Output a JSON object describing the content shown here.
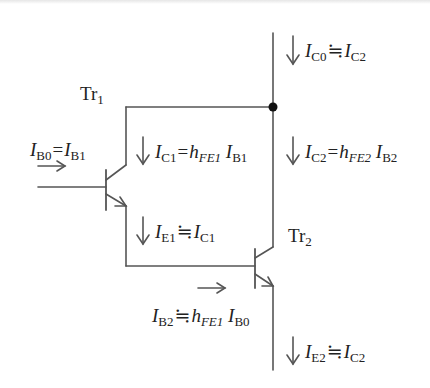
{
  "diagram": {
    "type": "darlington-pair-circuit",
    "transistors": [
      {
        "id": "tr1",
        "name": "Tr",
        "sub": "1"
      },
      {
        "id": "tr2",
        "name": "Tr",
        "sub": "2"
      }
    ],
    "labels": {
      "ic0": {
        "lhs": "I",
        "lhs_sub": "C0",
        "op": "≒",
        "rhs": "I",
        "rhs_sub": "C2"
      },
      "ib0": {
        "lhs": "I",
        "lhs_sub": "B0",
        "op": "=",
        "rhs": "I",
        "rhs_sub": "B1"
      },
      "ic1": {
        "lhs": "I",
        "lhs_sub": "C1",
        "op": "=",
        "coef": "h",
        "coef_sub": "FE1",
        "rhs": "I",
        "rhs_sub": "B1"
      },
      "ic2": {
        "lhs": "I",
        "lhs_sub": "C2",
        "op": "=",
        "coef": "h",
        "coef_sub": "FE2",
        "rhs": "I",
        "rhs_sub": "B2"
      },
      "ie1": {
        "lhs": "I",
        "lhs_sub": "E1",
        "op": "≒",
        "rhs": "I",
        "rhs_sub": "C1"
      },
      "ib2": {
        "lhs": "I",
        "lhs_sub": "B2",
        "op": "≒",
        "coef": "h",
        "coef_sub": "FE1",
        "rhs": "I",
        "rhs_sub": "B0"
      },
      "ie2": {
        "lhs": "I",
        "lhs_sub": "E2",
        "op": "≒",
        "rhs": "I",
        "rhs_sub": "C2"
      }
    },
    "arrows": {
      "down": "↓",
      "right": "→"
    },
    "colors": {
      "wire": "#555555",
      "text": "#222222",
      "junction": "#111111"
    }
  }
}
